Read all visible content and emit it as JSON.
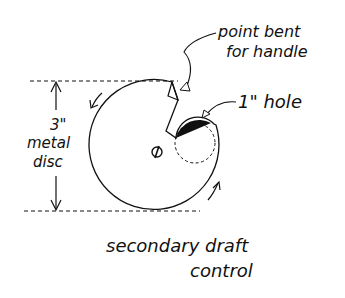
{
  "diagram": {
    "title_line1": "secondary draft",
    "title_line2": "control",
    "labels": {
      "handle_line1": "point bent",
      "handle_line2": "for handle",
      "hole": "1\" hole",
      "size_line1": "3\"",
      "size_line2": "metal",
      "size_line3": "disc"
    },
    "colors": {
      "ink": "#111111",
      "background": "#ffffff"
    }
  }
}
